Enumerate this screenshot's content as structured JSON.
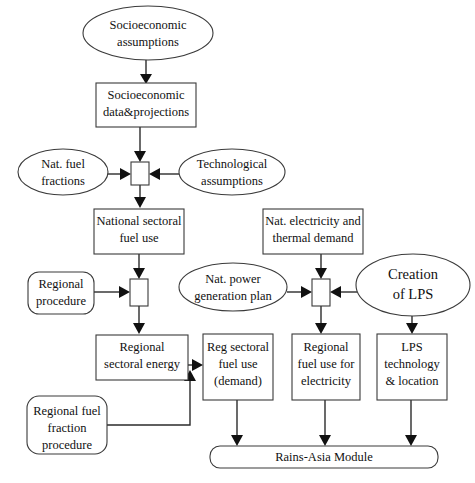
{
  "diagram": {
    "colors": {
      "background": "#ffffff",
      "stroke": "#3a3a3a",
      "arrow": "#111111",
      "text": "#111111"
    },
    "nodes": [
      {
        "id": "socio-assumptions",
        "shape": "ellipse",
        "lines": [
          "Socioeconomic",
          "assumptions"
        ],
        "cx": 148,
        "cy": 33,
        "rx": 65,
        "ry": 27,
        "font_size": 12.5
      },
      {
        "id": "socio-data",
        "shape": "rect",
        "lines": [
          "Socioeconomic",
          "data&projections"
        ],
        "x": 96,
        "y": 83,
        "w": 100,
        "h": 44,
        "font_size": 12.5
      },
      {
        "id": "nat-fuel-fractions",
        "shape": "ellipse",
        "lines": [
          "Nat. fuel",
          "fractions"
        ],
        "cx": 63,
        "cy": 172,
        "rx": 45,
        "ry": 23,
        "font_size": 12.5
      },
      {
        "id": "merge-national",
        "shape": "small-rect",
        "lines": [],
        "x": 131,
        "y": 162,
        "w": 18,
        "h": 23,
        "font_size": 0
      },
      {
        "id": "technological-assumptions",
        "shape": "ellipse",
        "lines": [
          "Technological",
          "assumptions"
        ],
        "cx": 232,
        "cy": 172,
        "rx": 53,
        "ry": 23,
        "font_size": 12.5
      },
      {
        "id": "national-sectoral-fuel-use",
        "shape": "rect",
        "lines": [
          "National sectoral",
          "fuel use"
        ],
        "x": 94,
        "y": 209,
        "w": 90,
        "h": 45,
        "font_size": 12.5
      },
      {
        "id": "nat-electricity-thermal-demand",
        "shape": "rect",
        "lines": [
          "Nat. electricity and",
          "thermal demand"
        ],
        "x": 263,
        "y": 209,
        "w": 100,
        "h": 45,
        "font_size": 12.5
      },
      {
        "id": "regional-procedure",
        "shape": "round-rect",
        "lines": [
          "Regional",
          "procedure"
        ],
        "x": 28,
        "y": 272,
        "w": 66,
        "h": 42,
        "font_size": 12.5
      },
      {
        "id": "merge-regional",
        "shape": "small-rect",
        "lines": [],
        "x": 130,
        "y": 279,
        "w": 18,
        "h": 27,
        "font_size": 0
      },
      {
        "id": "nat-power-generation-plan",
        "shape": "ellipse",
        "lines": [
          "Nat.  power",
          "generation plan"
        ],
        "cx": 233,
        "cy": 287,
        "rx": 54,
        "ry": 24,
        "font_size": 12.5
      },
      {
        "id": "merge-electricity",
        "shape": "small-rect",
        "lines": [],
        "x": 312,
        "y": 279,
        "w": 18,
        "h": 27,
        "font_size": 0
      },
      {
        "id": "creation-of-lps",
        "shape": "ellipse",
        "lines": [
          "Creation",
          "of  LPS"
        ],
        "cx": 413,
        "cy": 285,
        "rx": 57,
        "ry": 31,
        "font_size": 14.5
      },
      {
        "id": "regional-sectoral-energy",
        "shape": "rect",
        "lines": [
          "Regional",
          "sectoral energy"
        ],
        "x": 96,
        "y": 335,
        "w": 92,
        "h": 45,
        "font_size": 12.5
      },
      {
        "id": "reg-sectoral-fuel-use",
        "shape": "rect",
        "lines": [
          "Reg sectoral",
          "fuel use",
          "(demand)"
        ],
        "x": 203,
        "y": 334,
        "w": 70,
        "h": 66,
        "font_size": 12.5
      },
      {
        "id": "regional-fuel-use-electricity",
        "shape": "rect",
        "lines": [
          "Regional",
          "fuel use for",
          "electricity"
        ],
        "x": 292,
        "y": 334,
        "w": 68,
        "h": 66,
        "font_size": 12.5
      },
      {
        "id": "lps-technology-location",
        "shape": "rect",
        "lines": [
          "LPS",
          "technology",
          "& location"
        ],
        "x": 377,
        "y": 334,
        "w": 70,
        "h": 66,
        "font_size": 12.5
      },
      {
        "id": "regional-fuel-fraction-procedure",
        "shape": "round-rect",
        "lines": [
          "Regional fuel",
          "fraction",
          "procedure"
        ],
        "x": 27,
        "y": 396,
        "w": 80,
        "h": 58,
        "font_size": 12.5
      },
      {
        "id": "rains-asia-module",
        "shape": "round-rect-wide",
        "lines": [
          "Rains-Asia Module"
        ],
        "x": 210,
        "y": 446,
        "w": 228,
        "h": 22,
        "font_size": 12.5
      }
    ],
    "edges": [
      {
        "id": "e-socio-assumptions-to-data",
        "from": "socio-assumptions",
        "to": "socio-data",
        "kind": "vertical-arrow"
      },
      {
        "id": "e-socio-data-to-merge",
        "from": "socio-data",
        "to": "merge-national",
        "kind": "vertical-arrow"
      },
      {
        "id": "e-fuel-fractions-to-merge",
        "from": "nat-fuel-fractions",
        "to": "merge-national",
        "kind": "horizontal-arrow-right"
      },
      {
        "id": "e-tech-assumptions-to-merge",
        "from": "technological-assumptions",
        "to": "merge-national",
        "kind": "horizontal-arrow-left"
      },
      {
        "id": "e-merge-to-national-sectoral",
        "from": "merge-national",
        "to": "national-sectoral-fuel-use",
        "kind": "vertical-arrow"
      },
      {
        "id": "e-national-sectoral-to-merge-regional",
        "from": "national-sectoral-fuel-use",
        "to": "merge-regional",
        "kind": "vertical-arrow"
      },
      {
        "id": "e-regional-procedure-to-merge",
        "from": "regional-procedure",
        "to": "merge-regional",
        "kind": "horizontal-arrow-right"
      },
      {
        "id": "e-merge-regional-to-regional-sectoral",
        "from": "merge-regional",
        "to": "regional-sectoral-energy",
        "kind": "vertical-arrow"
      },
      {
        "id": "e-nat-electricity-to-merge-elec",
        "from": "nat-electricity-thermal-demand",
        "to": "merge-electricity",
        "kind": "vertical-arrow"
      },
      {
        "id": "e-power-plan-to-merge-elec",
        "from": "nat-power-generation-plan",
        "to": "merge-electricity",
        "kind": "horizontal-arrow-right"
      },
      {
        "id": "e-lps-to-merge-elec",
        "from": "creation-of-lps",
        "to": "merge-electricity",
        "kind": "horizontal-arrow-left"
      },
      {
        "id": "e-merge-elec-to-regional-fuel-elec",
        "from": "merge-electricity",
        "to": "regional-fuel-use-electricity",
        "kind": "vertical-arrow"
      },
      {
        "id": "e-lps-to-lps-tech",
        "from": "creation-of-lps",
        "to": "lps-technology-location",
        "kind": "vertical-arrow"
      },
      {
        "id": "e-regional-sectoral-to-reg-fuel-use",
        "from": "regional-sectoral-energy",
        "to": "reg-sectoral-fuel-use",
        "kind": "horizontal-arrow-right"
      },
      {
        "id": "e-fuel-fraction-proc-to-reg-fuel-use",
        "from": "regional-fuel-fraction-procedure",
        "to": "reg-sectoral-fuel-use",
        "kind": "elbow-up-arrow"
      },
      {
        "id": "e-reg-fuel-use-to-module",
        "from": "reg-sectoral-fuel-use",
        "to": "rains-asia-module",
        "kind": "vertical-arrow"
      },
      {
        "id": "e-regional-fuel-elec-to-module",
        "from": "regional-fuel-use-electricity",
        "to": "rains-asia-module",
        "kind": "vertical-arrow"
      },
      {
        "id": "e-lps-tech-to-module",
        "from": "lps-technology-location",
        "to": "rains-asia-module",
        "kind": "vertical-arrow"
      }
    ]
  }
}
